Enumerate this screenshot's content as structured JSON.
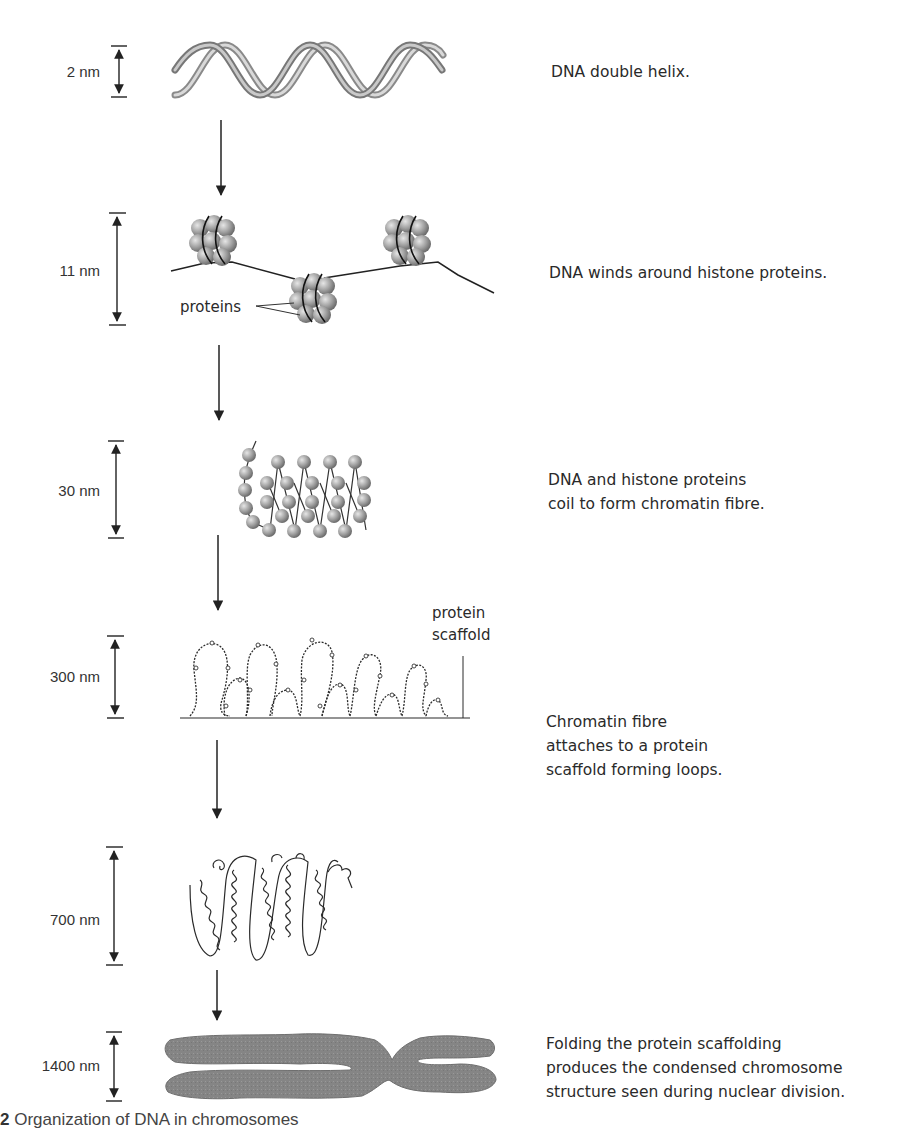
{
  "figure": {
    "caption_prefix": "2",
    "caption_text": "Organization of DNA in chromosomes"
  },
  "stages": [
    {
      "id": "helix",
      "scale": "2 nm",
      "description": [
        "DNA double helix."
      ]
    },
    {
      "id": "nucleosome",
      "scale": "11 nm",
      "description": [
        "DNA winds around histone proteins."
      ],
      "annotation": "proteins"
    },
    {
      "id": "chromatin",
      "scale": "30 nm",
      "description": [
        "DNA and histone proteins",
        "coil to form chromatin fibre."
      ]
    },
    {
      "id": "loops",
      "scale": "300 nm",
      "description": [
        "Chromatin fibre",
        "attaches to a protein",
        "scaffold forming loops."
      ],
      "annotation": [
        "protein",
        "scaffold"
      ]
    },
    {
      "id": "coiled",
      "scale": "700 nm",
      "description": []
    },
    {
      "id": "chromosome",
      "scale": "1400 nm",
      "description": [
        "Folding the protein scaffolding",
        "produces the condensed chromosome",
        "structure seen during nuclear division."
      ]
    }
  ],
  "colors": {
    "ink": "#2a2a2a",
    "histone": "#9a9a9a",
    "chromosome": "#7d7d7d",
    "helix": "#a8a8a8"
  }
}
